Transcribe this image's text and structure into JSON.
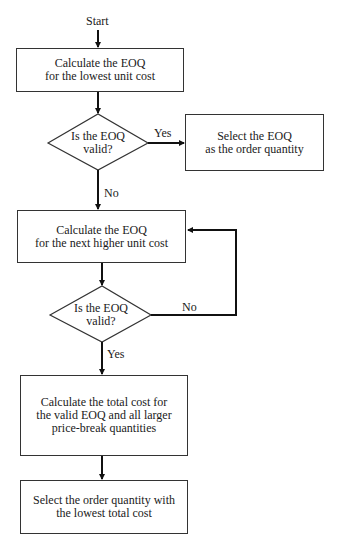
{
  "flowchart": {
    "start_label": "Start",
    "steps": [
      {
        "id": "calc-lowest",
        "type": "process",
        "text": "Calculate the EOQ\nfor the lowest unit cost"
      },
      {
        "id": "valid-1",
        "type": "decision",
        "text": "Is the EOQ\nvalid?"
      },
      {
        "id": "select-eoq",
        "type": "process",
        "text": "Select the EOQ\nas the order quantity"
      },
      {
        "id": "calc-next",
        "type": "process",
        "text": "Calculate the EOQ\nfor the next higher unit cost"
      },
      {
        "id": "valid-2",
        "type": "decision",
        "text": "Is the EOQ\nvalid?"
      },
      {
        "id": "calc-total",
        "type": "process",
        "text": "Calculate the total cost for\nthe valid EOQ and all larger\nprice-break quantities"
      },
      {
        "id": "select-lowest",
        "type": "process",
        "text": "Select the order quantity with\nthe lowest total cost"
      }
    ],
    "edges": [
      {
        "from": "start",
        "to": "calc-lowest",
        "label": ""
      },
      {
        "from": "calc-lowest",
        "to": "valid-1",
        "label": ""
      },
      {
        "from": "valid-1",
        "to": "select-eoq",
        "label": "Yes"
      },
      {
        "from": "valid-1",
        "to": "calc-next",
        "label": "No"
      },
      {
        "from": "calc-next",
        "to": "valid-2",
        "label": ""
      },
      {
        "from": "valid-2",
        "to": "calc-next",
        "label": "No"
      },
      {
        "from": "valid-2",
        "to": "calc-total",
        "label": "Yes"
      },
      {
        "from": "calc-total",
        "to": "select-lowest",
        "label": ""
      }
    ]
  }
}
